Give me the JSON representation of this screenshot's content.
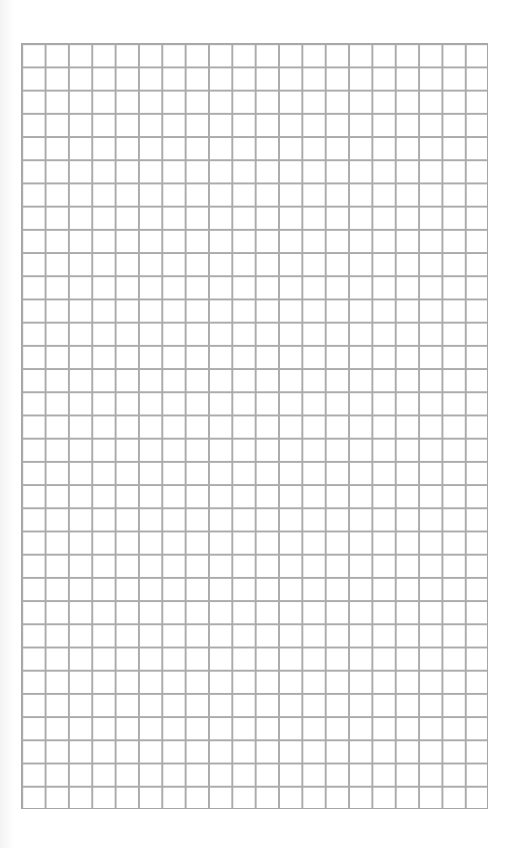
{
  "sheet": {
    "type": "graph paper",
    "columns": 20,
    "rows": 33,
    "line_color": "#ababab",
    "background_color": "#ffffff"
  }
}
